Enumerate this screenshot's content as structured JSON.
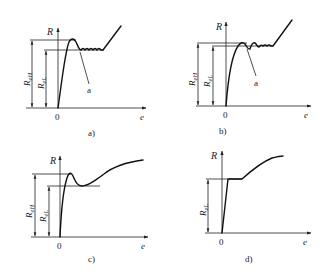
{
  "figure": {
    "panels": [
      {
        "id": "a",
        "caption": "a)",
        "y_axis_label": "R",
        "x_axis_label": "e",
        "origin_label": "0",
        "upper_yield_label": "R",
        "upper_yield_sub": "eH",
        "lower_yield_label": "R",
        "lower_yield_sub": "eL",
        "annotation": "a"
      },
      {
        "id": "b",
        "caption": "b)",
        "y_axis_label": "R",
        "x_axis_label": "e",
        "origin_label": "0",
        "upper_yield_label": "R",
        "upper_yield_sub": "eH",
        "lower_yield_label": "R",
        "lower_yield_sub": "eL",
        "annotation": "a"
      },
      {
        "id": "c",
        "caption": "c)",
        "y_axis_label": "R",
        "x_axis_label": "e",
        "origin_label": "0",
        "upper_yield_label": "R",
        "upper_yield_sub": "eH",
        "lower_yield_label": "R",
        "lower_yield_sub": "eL"
      },
      {
        "id": "d",
        "caption": "d)",
        "y_axis_label": "R",
        "x_axis_label": "e",
        "origin_label": "0",
        "lower_yield_label": "R",
        "lower_yield_sub": "eL"
      }
    ]
  }
}
